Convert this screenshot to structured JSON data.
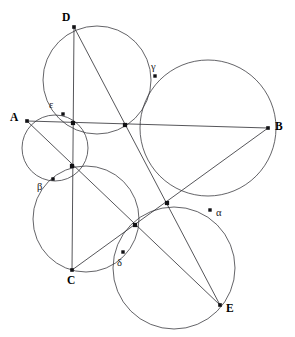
{
  "figure": {
    "width": 295,
    "height": 337,
    "background_color": "#ffffff",
    "stroke_color": "#3c3c41",
    "chord_color": "#2b2b30",
    "dot_color": "#111114"
  },
  "circles": [
    {
      "id": "circle-D",
      "cx": 97,
      "cy": 80,
      "r": 54
    },
    {
      "id": "circle-A",
      "cx": 55,
      "cy": 148,
      "r": 33
    },
    {
      "id": "circle-B",
      "cx": 208,
      "cy": 128,
      "r": 68
    },
    {
      "id": "circle-C",
      "cx": 86,
      "cy": 219,
      "r": 53
    },
    {
      "id": "circle-E",
      "cx": 174,
      "cy": 268,
      "r": 61
    }
  ],
  "chords": [
    {
      "id": "chord-AB",
      "from": "A",
      "to": "B"
    },
    {
      "id": "chord-AE",
      "from": "A",
      "to": "E"
    },
    {
      "id": "chord-BC",
      "from": "B",
      "to": "C"
    },
    {
      "id": "chord-CD",
      "from": "C",
      "to": "D"
    },
    {
      "id": "chord-DE",
      "from": "D",
      "to": "E"
    }
  ],
  "vertices": [
    {
      "id": "A",
      "label": "A",
      "x": 27,
      "y": 121,
      "label_x": 10,
      "label_y": 112
    },
    {
      "id": "B",
      "label": "B",
      "x": 268,
      "y": 128,
      "label_x": 275,
      "label_y": 121
    },
    {
      "id": "C",
      "label": "C",
      "x": 72,
      "y": 270,
      "label_x": 67,
      "label_y": 275
    },
    {
      "id": "D",
      "label": "D",
      "x": 74,
      "y": 27,
      "label_x": 62,
      "label_y": 12
    },
    {
      "id": "E",
      "label": "E",
      "x": 220,
      "y": 305,
      "label_x": 226,
      "label_y": 303
    }
  ],
  "intersection_nodes": [
    {
      "id": "node-upper-left",
      "x": 73,
      "y": 123
    },
    {
      "id": "node-center",
      "x": 125,
      "y": 125
    },
    {
      "id": "node-left",
      "x": 72,
      "y": 166
    },
    {
      "id": "node-lower-mid",
      "x": 135,
      "y": 225
    },
    {
      "id": "node-right",
      "x": 167,
      "y": 203
    }
  ],
  "greek_points": [
    {
      "id": "alpha",
      "label": "α",
      "x": 210,
      "y": 210,
      "label_x": 216,
      "label_y": 208
    },
    {
      "id": "beta",
      "label": "β",
      "x": 53,
      "y": 179,
      "label_x": 37,
      "label_y": 182
    },
    {
      "id": "gamma",
      "label": "γ",
      "x": 155,
      "y": 76,
      "label_x": 151,
      "label_y": 62
    },
    {
      "id": "delta",
      "label": "δ",
      "x": 123,
      "y": 252,
      "label_x": 117,
      "label_y": 258
    },
    {
      "id": "epsilon",
      "label": "ε",
      "x": 63,
      "y": 114,
      "label_x": 49,
      "label_y": 100
    }
  ]
}
